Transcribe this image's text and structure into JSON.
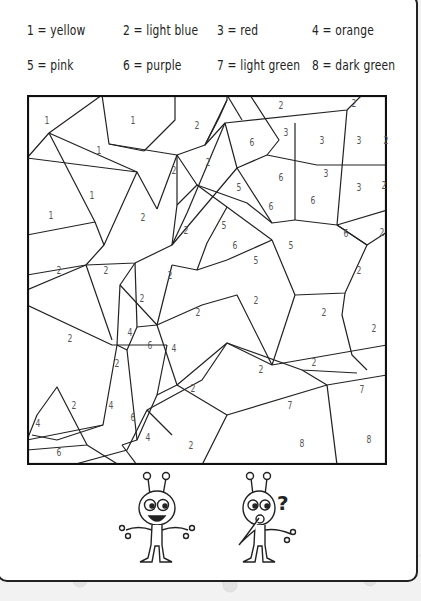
{
  "legend": [
    {
      "number": "1",
      "color": "yellow",
      "label": "1 = yellow"
    },
    {
      "number": "2",
      "color": "light blue",
      "label": "2 = light blue"
    },
    {
      "number": "3",
      "color": "red",
      "label": "3 = red"
    },
    {
      "number": "4",
      "color": "orange",
      "label": "4 = orange"
    },
    {
      "number": "5",
      "color": "pink",
      "label": "5 = pink"
    },
    {
      "number": "6",
      "color": "purple",
      "label": "6 = purple"
    },
    {
      "number": "7",
      "color": "light green",
      "label": "7 = light green"
    },
    {
      "number": "8",
      "color": "dark green",
      "label": "8 = dark green"
    }
  ],
  "puzzle": {
    "regions": [
      {
        "n": "1",
        "x": 20,
        "y": 25
      },
      {
        "n": "1",
        "x": 106,
        "y": 25
      },
      {
        "n": "2",
        "x": 170,
        "y": 30
      },
      {
        "n": "2",
        "x": 254,
        "y": 10
      },
      {
        "n": "2",
        "x": 327,
        "y": 8
      },
      {
        "n": "1",
        "x": 72,
        "y": 55
      },
      {
        "n": "6",
        "x": 225,
        "y": 47
      },
      {
        "n": "3",
        "x": 259,
        "y": 37
      },
      {
        "n": "3",
        "x": 295,
        "y": 45
      },
      {
        "n": "3",
        "x": 332,
        "y": 45
      },
      {
        "n": "2",
        "x": 359,
        "y": 45
      },
      {
        "n": "2",
        "x": 147,
        "y": 75
      },
      {
        "n": "2",
        "x": 181,
        "y": 67
      },
      {
        "n": "5",
        "x": 212,
        "y": 92
      },
      {
        "n": "6",
        "x": 254,
        "y": 82
      },
      {
        "n": "3",
        "x": 299,
        "y": 78
      },
      {
        "n": "3",
        "x": 332,
        "y": 92
      },
      {
        "n": "2",
        "x": 357,
        "y": 90
      },
      {
        "n": "1",
        "x": 65,
        "y": 100
      },
      {
        "n": "1",
        "x": 24,
        "y": 120
      },
      {
        "n": "2",
        "x": 116,
        "y": 122
      },
      {
        "n": "6",
        "x": 244,
        "y": 111
      },
      {
        "n": "6",
        "x": 286,
        "y": 105
      },
      {
        "n": "2",
        "x": 159,
        "y": 135
      },
      {
        "n": "5",
        "x": 197,
        "y": 130
      },
      {
        "n": "6",
        "x": 208,
        "y": 150
      },
      {
        "n": "5",
        "x": 264,
        "y": 150
      },
      {
        "n": "6",
        "x": 319,
        "y": 138
      },
      {
        "n": "2",
        "x": 355,
        "y": 137
      },
      {
        "n": "5",
        "x": 229,
        "y": 165
      },
      {
        "n": "2",
        "x": 32,
        "y": 175
      },
      {
        "n": "2",
        "x": 79,
        "y": 175
      },
      {
        "n": "2",
        "x": 143,
        "y": 180
      },
      {
        "n": "2",
        "x": 332,
        "y": 175
      },
      {
        "n": "2",
        "x": 115,
        "y": 203
      },
      {
        "n": "2",
        "x": 171,
        "y": 217
      },
      {
        "n": "2",
        "x": 229,
        "y": 205
      },
      {
        "n": "2",
        "x": 297,
        "y": 217
      },
      {
        "n": "2",
        "x": 347,
        "y": 233
      },
      {
        "n": "4",
        "x": 103,
        "y": 237
      },
      {
        "n": "2",
        "x": 43,
        "y": 243
      },
      {
        "n": "6",
        "x": 123,
        "y": 250
      },
      {
        "n": "4",
        "x": 147,
        "y": 253
      },
      {
        "n": "2",
        "x": 90,
        "y": 268
      },
      {
        "n": "2",
        "x": 166,
        "y": 293
      },
      {
        "n": "2",
        "x": 234,
        "y": 274
      },
      {
        "n": "2",
        "x": 287,
        "y": 267
      },
      {
        "n": "2",
        "x": 47,
        "y": 310
      },
      {
        "n": "4",
        "x": 84,
        "y": 310
      },
      {
        "n": "6",
        "x": 106,
        "y": 322
      },
      {
        "n": "7",
        "x": 263,
        "y": 310
      },
      {
        "n": "7",
        "x": 335,
        "y": 294
      },
      {
        "n": "4",
        "x": 11,
        "y": 328
      },
      {
        "n": "4",
        "x": 121,
        "y": 342
      },
      {
        "n": "2",
        "x": 164,
        "y": 350
      },
      {
        "n": "8",
        "x": 275,
        "y": 348
      },
      {
        "n": "8",
        "x": 342,
        "y": 344
      },
      {
        "n": "6",
        "x": 32,
        "y": 357
      }
    ]
  },
  "characters": [
    {
      "name": "happy alien",
      "expression": "smiling"
    },
    {
      "name": "thinking alien",
      "expression": "question",
      "symbol": "?"
    }
  ]
}
